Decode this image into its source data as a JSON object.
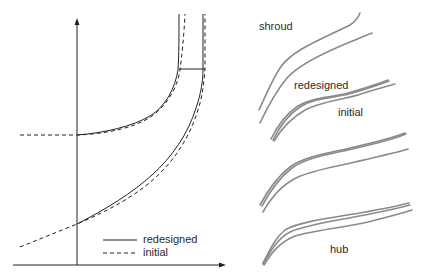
{
  "meridional_view": {
    "legend": [
      {
        "label": "redesigned",
        "style": "solid"
      },
      {
        "label": "initial",
        "style": "dashed"
      }
    ],
    "curves": [
      "shroud-redesigned",
      "shroud-initial",
      "hub-redesigned",
      "hub-initial"
    ],
    "axes": {
      "x_arrow": true,
      "y_arrow": true
    }
  },
  "blade_view": {
    "labels": {
      "shroud": "shroud",
      "redesigned": "redesigned",
      "initial": "initial",
      "hub": "hub"
    },
    "blade_sections": 4
  },
  "colors": {
    "line": "#222222",
    "blade": "#8a8a8a"
  }
}
